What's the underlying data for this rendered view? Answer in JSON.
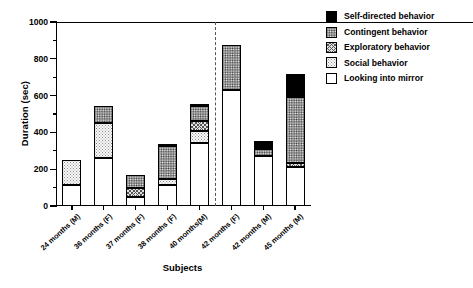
{
  "chart_data": {
    "type": "bar",
    "stacked": true,
    "title": "",
    "xlabel": "Subjects",
    "ylabel": "Duration (sec)",
    "ylim": [
      0,
      1000
    ],
    "ytick_labels": [
      "0",
      "200",
      "400",
      "600",
      "800",
      "1000"
    ],
    "ytick_values": [
      0,
      200,
      400,
      600,
      800,
      1000
    ],
    "yminor_values": [
      100,
      300,
      500,
      700,
      900
    ],
    "grid": false,
    "legend_position": "top-right",
    "categories": [
      "24 months (M)",
      "36 months (F)",
      "37 months (F)",
      "38 months (F)",
      "40 months(M)",
      "42 months (F)",
      "42 months (M)",
      "45 months (M)"
    ],
    "series": [
      {
        "name": "Looking into mirror",
        "color": "#ffffff",
        "pattern": "solid-white",
        "values": [
          115,
          260,
          50,
          115,
          340,
          630,
          270,
          210
        ]
      },
      {
        "name": "Social behavior",
        "color": "#fbfbfb",
        "pattern": "fine-dots",
        "values": [
          135,
          190,
          0,
          30,
          70,
          0,
          0,
          0
        ]
      },
      {
        "name": "Exploratory behavior",
        "color": "#e3e3e3",
        "pattern": "cross-hatch",
        "values": [
          0,
          0,
          50,
          0,
          50,
          0,
          0,
          25
        ]
      },
      {
        "name": "Contingent behavior",
        "color": "#8f8f8f",
        "pattern": "coarse-dots",
        "values": [
          0,
          95,
          70,
          180,
          85,
          245,
          40,
          360
        ]
      },
      {
        "name": "Self-directed behavior",
        "color": "#000000",
        "pattern": "solid-black",
        "values": [
          0,
          0,
          0,
          10,
          10,
          0,
          45,
          120
        ]
      }
    ],
    "totals": [
      250,
      545,
      170,
      335,
      555,
      875,
      355,
      715
    ],
    "annotations": {
      "divider_after_category_index": 4,
      "divider_style": "dashed-vertical"
    }
  },
  "legend": {
    "items": [
      {
        "label": "Self-directed behavior",
        "swatch": "swatch-self-directed"
      },
      {
        "label": "Contingent behavior",
        "swatch": "swatch-contingent"
      },
      {
        "label": "Exploratory behavior",
        "swatch": "swatch-exploratory"
      },
      {
        "label": "Social behavior",
        "swatch": "swatch-social"
      },
      {
        "label": "Looking into mirror",
        "swatch": "swatch-looking-into-mirror"
      }
    ]
  }
}
